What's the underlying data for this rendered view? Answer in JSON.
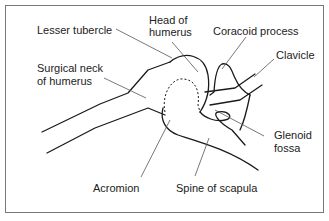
{
  "diagram": {
    "labels": {
      "lesser_tubercle": "Lesser tubercle",
      "head_of_humerus_1": "Head of",
      "head_of_humerus_2": "humerus",
      "coracoid_process": "Coracoid process",
      "clavicle": "Clavicle",
      "surgical_neck_1": "Surgical neck",
      "surgical_neck_2": "of humerus",
      "glenoid_fossa_1": "Glenoid",
      "glenoid_fossa_2": "fossa",
      "acromion": "Acromion",
      "spine_of_scapula": "Spine of scapula"
    },
    "colors": {
      "line": "#1a1a1a",
      "leader": "#555555",
      "border": "#777777",
      "background": "#ffffff"
    }
  }
}
